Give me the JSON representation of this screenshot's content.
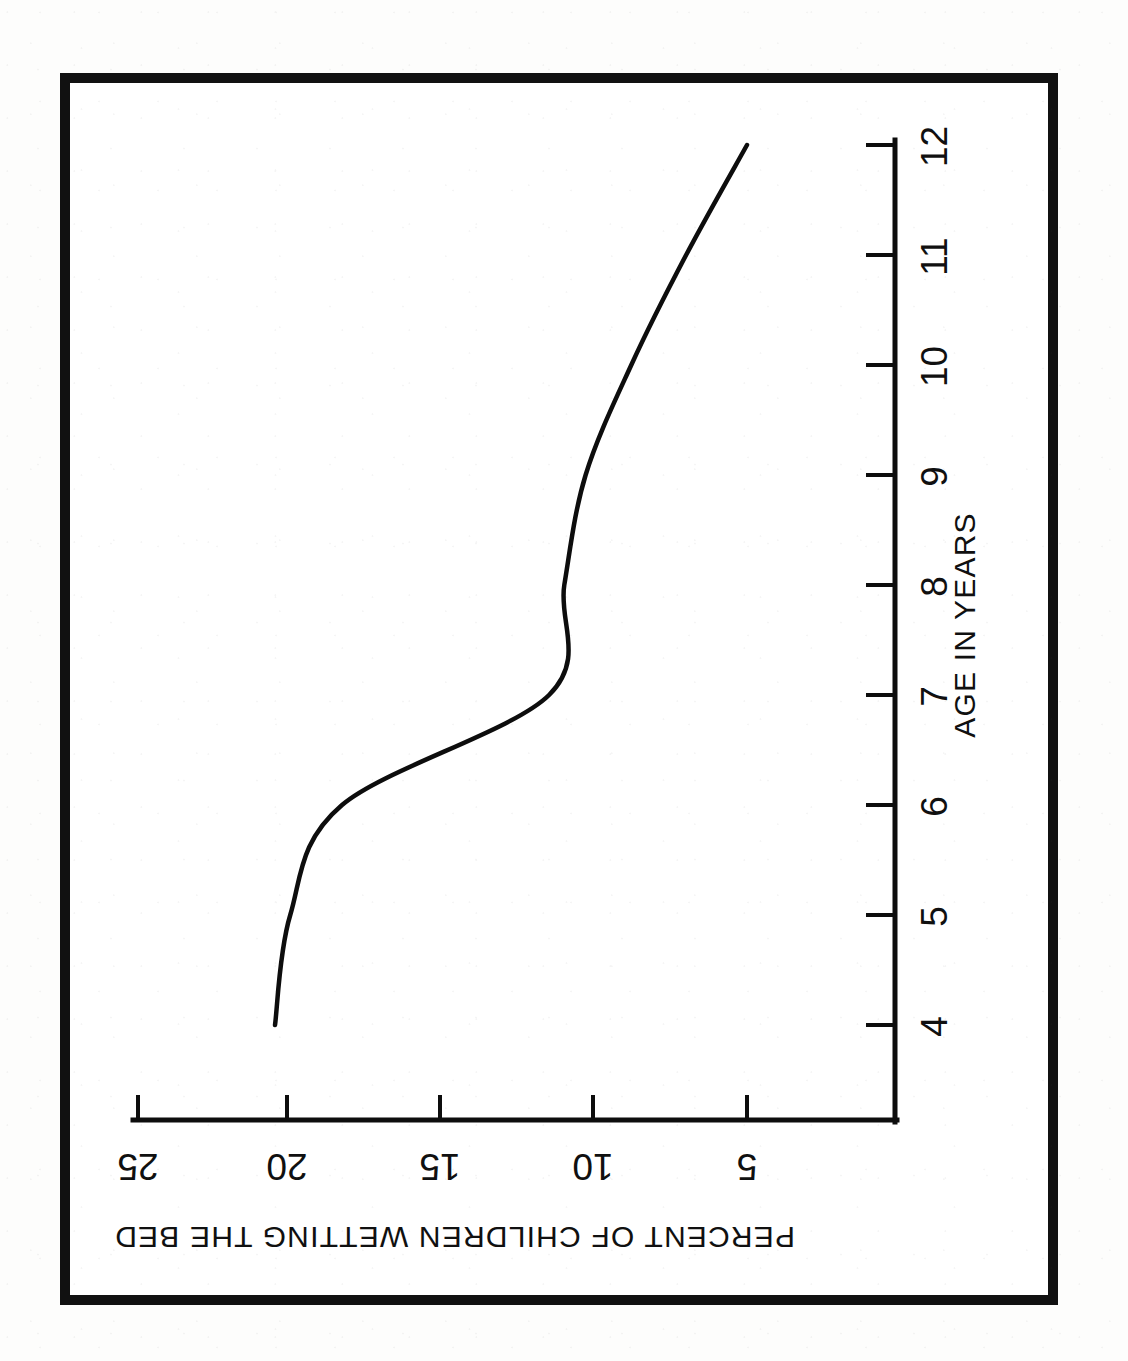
{
  "figure": {
    "orientation_note": "rotated-90-clockwise",
    "border_color": "#111111",
    "ink_color": "#0d0d0d",
    "paper_color": "#fdfdfc"
  },
  "chart_data": {
    "type": "line",
    "title": "",
    "subtitle": "",
    "xlabel": "AGE IN YEARS",
    "ylabel": "PERCENT OF CHILDREN WETTING THE BED",
    "x": [
      4,
      5,
      6,
      7,
      8,
      9,
      10,
      11,
      12
    ],
    "values": [
      20.5,
      20.0,
      18.3,
      11.5,
      11.0,
      10.3,
      8.8,
      7.0,
      5.0
    ],
    "series": [
      {
        "name": "Percent of children wetting the bed",
        "values": [
          20.5,
          20.0,
          18.3,
          11.5,
          11.0,
          10.3,
          8.8,
          7.0,
          5.0
        ]
      }
    ],
    "xticks": [
      "4",
      "5",
      "6",
      "7",
      "8",
      "9",
      "10",
      "11",
      "12"
    ],
    "yticks": [
      "5",
      "10",
      "15",
      "20",
      "25"
    ],
    "xlim": [
      4,
      12
    ],
    "ylim": [
      2.5,
      26.5
    ],
    "grid": false,
    "legend": false,
    "legend_position": "none",
    "line_color": "#0d0d0d",
    "markers": false,
    "annotations": []
  },
  "axes": {
    "value_axis": {
      "name": "percent-axis",
      "title": "PERCENT OF CHILDREN WETTING THE BED",
      "ticks": [
        {
          "label": "25",
          "value": 25
        },
        {
          "label": "20",
          "value": 20
        },
        {
          "label": "15",
          "value": 15
        },
        {
          "label": "10",
          "value": 10
        },
        {
          "label": "5",
          "value": 5
        }
      ]
    },
    "age_axis": {
      "name": "age-axis",
      "title": "AGE IN YEARS",
      "ticks": [
        {
          "label": "12",
          "value": 12
        },
        {
          "label": "11",
          "value": 11
        },
        {
          "label": "10",
          "value": 10
        },
        {
          "label": "9",
          "value": 9
        },
        {
          "label": "8",
          "value": 8
        },
        {
          "label": "7",
          "value": 7
        },
        {
          "label": "6",
          "value": 6
        },
        {
          "label": "5",
          "value": 5
        },
        {
          "label": "4",
          "value": 4
        }
      ]
    }
  }
}
